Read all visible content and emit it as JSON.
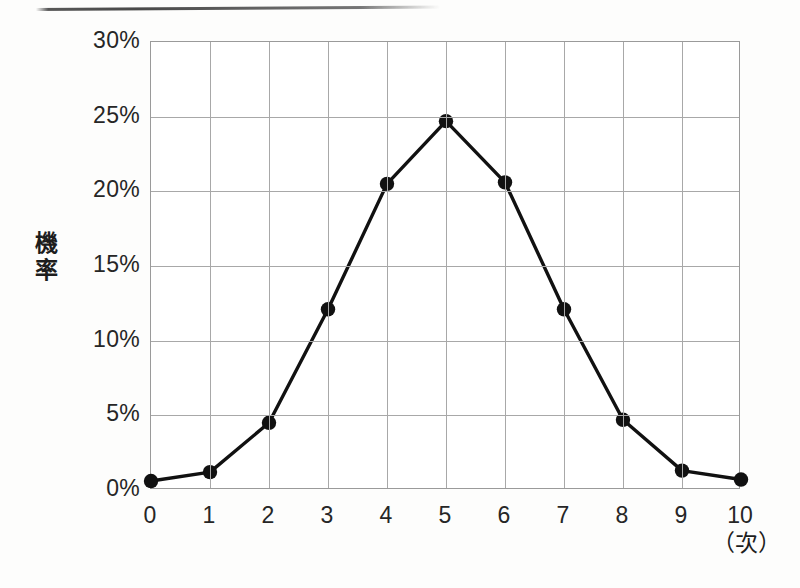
{
  "chart_data": {
    "type": "line",
    "title": "",
    "subtitle": "",
    "xlabel": "（次）",
    "ylabel": "機率",
    "x": [
      0,
      1,
      2,
      3,
      4,
      5,
      6,
      7,
      8,
      9,
      10
    ],
    "values": [
      0.6,
      1.2,
      4.5,
      12.1,
      20.5,
      24.7,
      20.6,
      12.1,
      4.7,
      1.3,
      0.7
    ],
    "series": [
      {
        "name": "機率",
        "values": [
          0.6,
          1.2,
          4.5,
          12.1,
          20.5,
          24.7,
          20.6,
          12.1,
          4.7,
          1.3,
          0.7
        ]
      }
    ],
    "xlim": [
      0,
      10
    ],
    "ylim": [
      0,
      30
    ],
    "ytick_values": [
      0,
      5,
      10,
      15,
      20,
      25,
      30
    ],
    "ytick_labels": [
      "0%",
      "5%",
      "10%",
      "15%",
      "20%",
      "25%",
      "30%"
    ],
    "xtick_values": [
      0,
      1,
      2,
      3,
      4,
      5,
      6,
      7,
      8,
      9,
      10
    ],
    "xtick_labels": [
      "0",
      "1",
      "2",
      "3",
      "4",
      "5",
      "6",
      "7",
      "8",
      "9",
      "10"
    ],
    "grid": true,
    "legend": false,
    "legend_position": "none",
    "marker": "filled-circle",
    "line_color": "#111111",
    "marker_color": "#111111",
    "grid_color": "#a8a8a8",
    "annotations": []
  },
  "axis_titles": {
    "y_chars": [
      "機",
      "率"
    ],
    "x_unit": "（次）"
  },
  "colors": {
    "background": "#fdfdfc",
    "plot_background": "#ffffff",
    "ink": "#111111",
    "grid": "#a8a8a8",
    "frame": "#9a9a9a",
    "text": "#262626"
  },
  "artifacts": {
    "top_rule": "scan-streak"
  }
}
